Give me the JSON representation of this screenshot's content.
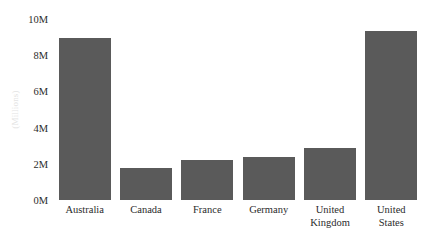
{
  "chart_data": {
    "type": "bar",
    "title": "",
    "subtitle": "",
    "xlabel": "",
    "ylabel": "(Millions)",
    "categories": [
      "Australia",
      "Canada",
      "France",
      "Germany",
      "United Kingdom",
      "United States"
    ],
    "category_lines": [
      [
        "Australia"
      ],
      [
        "Canada"
      ],
      [
        "France"
      ],
      [
        "Germany"
      ],
      [
        "United",
        "Kingdom"
      ],
      [
        "United",
        "States"
      ]
    ],
    "values": [
      8950000,
      1750000,
      2200000,
      2350000,
      2900000,
      9320000
    ],
    "values_millions": [
      8.95,
      1.75,
      2.2,
      2.35,
      2.9,
      9.32
    ],
    "ylim": [
      0,
      10000000
    ],
    "ylim_millions": [
      0,
      10
    ],
    "ytick_values": [
      0,
      2000000,
      4000000,
      6000000,
      8000000,
      10000000
    ],
    "ytick_labels": [
      "0M",
      "2M",
      "4M",
      "6M",
      "8M",
      "10M"
    ],
    "grid": false,
    "legend": false,
    "legend_position": "none",
    "bar_color": "#5a5a5a",
    "background_color": "#ffffff",
    "axis_label_color": "#e3e3e3",
    "tick_label_color": "#2b2b2b"
  }
}
